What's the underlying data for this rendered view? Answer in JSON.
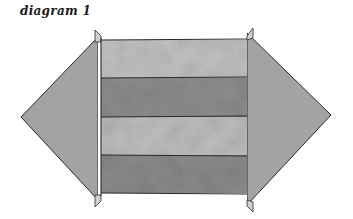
{
  "caption": "diagram 1",
  "colors": {
    "stroke": "#2a2a2a",
    "arrowhead_fill": "#a6a6a6",
    "stripe_light": "#bdbdbd",
    "stripe_dark": "#8a8a8a",
    "background": "#ffffff"
  },
  "diagram": {
    "left_arrowhead": {
      "direction": "left",
      "apex": [
        21,
        117
      ],
      "base_top": [
        98,
        37
      ],
      "base_bottom": [
        98,
        200
      ]
    },
    "right_arrowhead": {
      "direction": "right",
      "apex": [
        331,
        115
      ],
      "base_top": [
        247,
        33
      ],
      "base_bottom": [
        247,
        205
      ]
    },
    "stripes": [
      {
        "index": 1,
        "shade": "light"
      },
      {
        "index": 2,
        "shade": "dark"
      },
      {
        "index": 3,
        "shade": "light"
      },
      {
        "index": 4,
        "shade": "dark"
      }
    ]
  }
}
